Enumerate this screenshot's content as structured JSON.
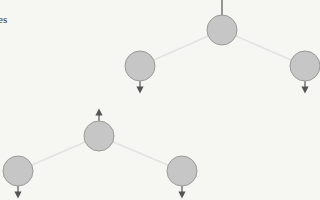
{
  "caption_fragment": "es",
  "colors": {
    "background": "#f6f6f3",
    "node_fill": "#c6c6c6",
    "node_stroke": "#9a9a9a",
    "edge": "#e2e2e2",
    "arrow": "#555555"
  },
  "trees": [
    {
      "name": "upper-tree",
      "parent": {
        "x": 222,
        "y": 30,
        "r": 15,
        "arrow": "up-line"
      },
      "children": [
        {
          "x": 140,
          "y": 66,
          "r": 15,
          "arrow": "down"
        },
        {
          "x": 305,
          "y": 66,
          "r": 15,
          "arrow": "down"
        }
      ]
    },
    {
      "name": "lower-tree",
      "parent": {
        "x": 99,
        "y": 136,
        "r": 15,
        "arrow": "up"
      },
      "children": [
        {
          "x": 18,
          "y": 171,
          "r": 15,
          "arrow": "down"
        },
        {
          "x": 182,
          "y": 171,
          "r": 15,
          "arrow": "down"
        }
      ]
    }
  ]
}
